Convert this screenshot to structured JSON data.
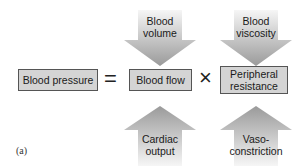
{
  "diagram": {
    "panel_label": "(a)",
    "equation": {
      "lhs": "Blood pressure",
      "equals": "=",
      "term1": "Blood flow",
      "times": "×",
      "term2": "Peripheral resistance"
    },
    "inputs_top": [
      {
        "label_line1": "Blood",
        "label_line2": "volume",
        "direction": "down",
        "target": "Blood flow"
      },
      {
        "label_line1": "Blood",
        "label_line2": "viscosity",
        "direction": "down",
        "target": "Peripheral resistance"
      }
    ],
    "inputs_bottom": [
      {
        "label_line1": "Cardiac",
        "label_line2": "output",
        "direction": "up",
        "target": "Blood flow"
      },
      {
        "label_line1": "Vaso-",
        "label_line2": "constriction",
        "direction": "up",
        "target": "Peripheral resistance"
      }
    ],
    "colors": {
      "box_fill": "#d4d4d4",
      "arrow_dark": "#9a9a9a",
      "arrow_light": "#f4f4f4"
    }
  }
}
